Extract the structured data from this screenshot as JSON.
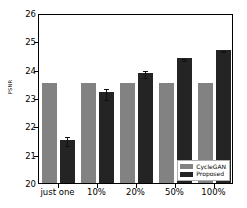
{
  "chart_data": {
    "type": "bar",
    "title": "",
    "xlabel": "",
    "ylabel": "PSNR",
    "categories": [
      "just one",
      "10%",
      "20%",
      "50%",
      "100%"
    ],
    "ylim": [
      20,
      26
    ],
    "yticks": [
      20,
      21,
      22,
      23,
      24,
      25,
      26
    ],
    "grid": false,
    "legend_position": "lower right",
    "series": [
      {
        "name": "CycleGAN",
        "color": "#828282",
        "values": [
          23.53,
          23.53,
          23.53,
          23.53,
          23.53
        ],
        "errors": [
          0,
          0,
          0,
          0,
          0
        ]
      },
      {
        "name": "Proposed",
        "color": "#242424",
        "values": [
          21.52,
          23.2,
          23.9,
          24.41,
          24.7
        ],
        "errors": [
          0.16,
          0.19,
          0.11,
          0.04,
          0.02
        ]
      }
    ]
  },
  "legend": {
    "items": [
      {
        "label": "CycleGAN"
      },
      {
        "label": "Proposed"
      }
    ]
  }
}
